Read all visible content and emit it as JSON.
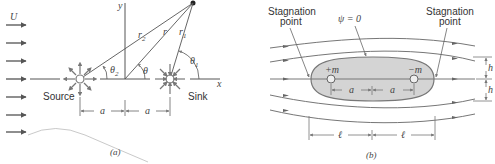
{
  "panel_a": {
    "caption": "(a)",
    "free_stream_label": "U",
    "axis_x_label": "x",
    "axis_y_label": "y",
    "source_label": "Source",
    "sink_label": "Sink",
    "r_label": "r",
    "r1_label": "r",
    "r1_sub": "1",
    "r2_label": "r",
    "r2_sub": "2",
    "theta_label": "θ",
    "theta1_label": "θ",
    "theta1_sub": "1",
    "theta2_label": "θ",
    "theta2_sub": "2",
    "spacing_left": "a",
    "spacing_right": "a"
  },
  "panel_b": {
    "caption": "(b)",
    "stagnation_left_line1": "Stagnation",
    "stagnation_left_line2": "point",
    "stagnation_right_line1": "Stagnation",
    "stagnation_right_line2": "point",
    "psi_label": "ψ = 0",
    "source_strength": "+m",
    "sink_strength": "−m",
    "spacing_left": "a",
    "spacing_right": "a",
    "half_length_left": "ℓ",
    "half_length_right": "ℓ",
    "half_width_top": "h",
    "half_width_bottom": "h"
  },
  "colors": {
    "line": "#555555",
    "body_fill": "#d4d4d4",
    "body_stroke": "#777777",
    "arrow": "#666666"
  }
}
